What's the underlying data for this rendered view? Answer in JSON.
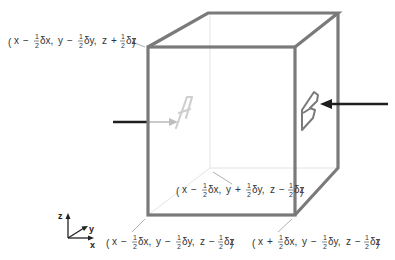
{
  "diagram": {
    "faces": [
      {
        "label": "A",
        "color": "#c8c8c8",
        "position": "back-left face (hidden, seen through cube)"
      },
      {
        "label": "B",
        "color": "#777777",
        "position": "right face"
      }
    ],
    "corners": [
      {
        "id": "top-front-left",
        "label_parts": [
          "x",
          "−",
          "δx",
          "y",
          "−",
          "δy",
          "z",
          "+",
          "δz"
        ],
        "text": "(x − ½δx, y − ½δy, z + ½δz)"
      },
      {
        "id": "back-bottom-left",
        "text": "(x − ½δx, y + ½δy, z − ½δz)"
      },
      {
        "id": "bottom-front-left",
        "text": "(x − ½δx, y − ½δy, z − ½δz)"
      },
      {
        "id": "bottom-front-right",
        "text": "(x + ½δx, y − ½δy, z − ½δz)"
      }
    ],
    "labels": {
      "c1": {
        "x": "x",
        "op1": "−",
        "dx": "δx,",
        "y": "y",
        "op2": "−",
        "dy": "δy,",
        "z": "z",
        "op3": "+",
        "dz": "δz"
      },
      "c2": {
        "x": "x",
        "op1": "−",
        "dx": "δx,",
        "y": "y",
        "op2": "+",
        "dy": "δy,",
        "z": "z",
        "op3": "−",
        "dz": "δz"
      },
      "c3": {
        "x": "x",
        "op1": "−",
        "dx": "δx,",
        "y": "y",
        "op2": "−",
        "dy": "δy,",
        "z": "z",
        "op3": "−",
        "dz": "δz"
      },
      "c4": {
        "x": "x",
        "op1": "+",
        "dx": "δx,",
        "y": "y",
        "op2": "−",
        "dy": "δy,",
        "z": "z",
        "op3": "−",
        "dz": "δz"
      },
      "half_num": "1",
      "half_den": "2",
      "lparen": "(",
      "rparen": ")"
    },
    "axes": {
      "x": "x",
      "y": "y",
      "z": "z"
    },
    "face_labels": {
      "a": "A",
      "b": "B"
    },
    "colors": {
      "edge": "#7a7a7a",
      "hidden_edge": "#e6e6e6",
      "arrow_in": "#222222",
      "arrow_through": "#bbbbbb",
      "leader": "#aaaaaa"
    }
  }
}
